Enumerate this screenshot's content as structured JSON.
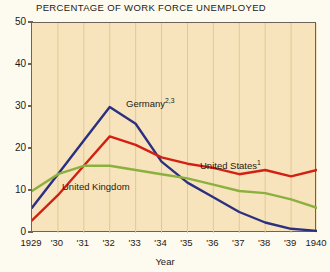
{
  "chart_data": {
    "type": "line",
    "title": "PERCENTAGE OF WORK FORCE UNEMPLOYED",
    "xlabel": "Year",
    "ylabel": "",
    "xlim": [
      1929,
      1940
    ],
    "ylim": [
      0,
      50
    ],
    "grid": "vertical",
    "legend_position": "inline-annotations",
    "x": [
      1929,
      1930,
      1931,
      1932,
      1933,
      1934,
      1935,
      1936,
      1937,
      1938,
      1939,
      1940
    ],
    "x_tick_labels": [
      "1929",
      "'30",
      "'31",
      "'32",
      "'33",
      "'34",
      "'35",
      "'36",
      "'37",
      "'38",
      "'39",
      "1940"
    ],
    "y_tick_labels": [
      "0",
      "10",
      "20",
      "30",
      "40",
      "50"
    ],
    "y_ticks": [
      0,
      10,
      20,
      30,
      40,
      50
    ],
    "series": [
      {
        "name": "Germany",
        "annotation": "Germany",
        "annotation_superscript": "2,3",
        "color": "#2b3080",
        "values": [
          6,
          14,
          22,
          30,
          26,
          17,
          12,
          8.5,
          5,
          2.5,
          1,
          0.5
        ]
      },
      {
        "name": "United States",
        "annotation": "United States",
        "annotation_superscript": "1",
        "color": "#d32014",
        "values": [
          3,
          9,
          16,
          23,
          21,
          18,
          16.5,
          15.5,
          14,
          15,
          13.5,
          15
        ]
      },
      {
        "name": "United Kingdom",
        "annotation": "United Kingdom",
        "annotation_superscript": "",
        "color": "#8cb03f",
        "values": [
          10,
          14,
          16,
          16,
          15,
          14,
          13,
          11.5,
          10,
          9.5,
          8,
          6
        ]
      }
    ],
    "colors": {
      "plot_background": "#f7e4bc",
      "page_background": "#fdfaf0",
      "frame": "#6d6258",
      "gridline": "#e2c893",
      "text": "#1e1a16"
    }
  },
  "annotations": {
    "germany": {
      "label": "Germany",
      "sup": "2,3"
    },
    "united_states": {
      "label": "United States",
      "sup": "1"
    },
    "united_kingdom": {
      "label": "United Kingdom",
      "sup": ""
    }
  }
}
